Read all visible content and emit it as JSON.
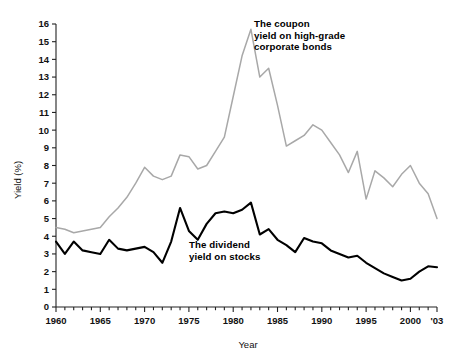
{
  "chart_data": {
    "type": "line",
    "title": "",
    "xlabel": "Year",
    "ylabel": "Yield (%)",
    "xlim": [
      1960,
      2003
    ],
    "ylim": [
      0,
      16
    ],
    "grid": false,
    "legend_position": "inline-annotations",
    "x_tick_labels": [
      "1960",
      "1965",
      "1970",
      "1975",
      "1980",
      "1985",
      "1990",
      "1995",
      "2000",
      "'03"
    ],
    "x_tick_values": [
      1960,
      1965,
      1970,
      1975,
      1980,
      1985,
      1990,
      1995,
      2000,
      2003
    ],
    "y_tick_labels": [
      "0",
      "1",
      "2",
      "3",
      "4",
      "5",
      "6",
      "7",
      "8",
      "9",
      "10",
      "11",
      "12",
      "13",
      "14",
      "15",
      "16"
    ],
    "y_tick_values": [
      0,
      1,
      2,
      3,
      4,
      5,
      6,
      7,
      8,
      9,
      10,
      11,
      12,
      13,
      14,
      15,
      16
    ],
    "x": [
      1960,
      1961,
      1962,
      1963,
      1964,
      1965,
      1966,
      1967,
      1968,
      1969,
      1970,
      1971,
      1972,
      1973,
      1974,
      1975,
      1976,
      1977,
      1978,
      1979,
      1980,
      1981,
      1982,
      1983,
      1984,
      1985,
      1986,
      1987,
      1988,
      1989,
      1990,
      1991,
      1992,
      1993,
      1994,
      1995,
      1996,
      1997,
      1998,
      1999,
      2000,
      2001,
      2002,
      2003
    ],
    "series": [
      {
        "name": "The coupon yield on high-grade corporate bonds",
        "color": "#a8a8a8",
        "values": [
          4.5,
          4.4,
          4.2,
          4.3,
          4.4,
          4.5,
          5.1,
          5.6,
          6.2,
          7.0,
          7.9,
          7.4,
          7.2,
          7.4,
          8.6,
          8.5,
          7.8,
          8.0,
          8.8,
          9.6,
          11.9,
          14.2,
          15.7,
          13.0,
          13.5,
          11.4,
          9.1,
          9.4,
          9.7,
          10.3,
          10.0,
          9.3,
          8.6,
          7.6,
          8.8,
          6.1,
          7.7,
          7.3,
          6.8,
          7.5,
          8.0,
          7.0,
          6.4,
          5.0
        ]
      },
      {
        "name": "The dividend yield on stocks",
        "color": "#000000",
        "values": [
          3.7,
          3.0,
          3.7,
          3.2,
          3.1,
          3.0,
          3.8,
          3.3,
          3.2,
          3.3,
          3.4,
          3.1,
          2.5,
          3.7,
          5.6,
          4.3,
          3.8,
          4.7,
          5.3,
          5.4,
          5.3,
          5.5,
          5.9,
          4.1,
          4.4,
          3.8,
          3.5,
          3.1,
          3.9,
          3.7,
          3.6,
          3.2,
          3.0,
          2.8,
          2.9,
          2.5,
          2.2,
          1.9,
          1.7,
          1.5,
          1.6,
          2.0,
          2.3,
          2.25
        ]
      }
    ]
  },
  "annotations": {
    "bonds": {
      "line1": "The coupon",
      "line2": "yield on high-grade",
      "line3": "corporate bonds"
    },
    "stocks": {
      "line1": "The dividend",
      "line2": "yield on stocks"
    }
  }
}
